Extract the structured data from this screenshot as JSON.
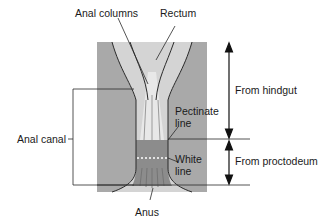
{
  "diagram": {
    "labels": {
      "anal_columns": "Anal columns",
      "rectum": "Rectum",
      "anal_canal": "Anal canal",
      "pectinate_line_1": "Pectinate",
      "pectinate_line_2": "line",
      "white_line_1": "White",
      "white_line_2": "line",
      "anus": "Anus",
      "from_hindgut": "From hindgut",
      "from_proctodeum": "From proctodeum"
    },
    "colors": {
      "outer_tissue": "#a9a9a9",
      "lumen": "#d4d4d4",
      "columns": "#e6e6e6",
      "lower_canal": "#8c8c8c",
      "outline": "#2a2a2a",
      "white_line": "#ffffff"
    }
  }
}
